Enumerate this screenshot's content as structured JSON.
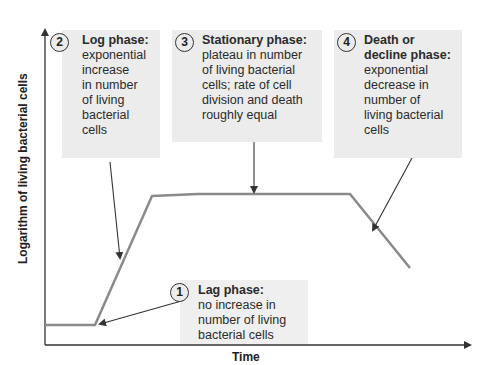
{
  "axes": {
    "y_label": "Logarithm of living bacterial cells",
    "x_label": "Time"
  },
  "phases": [
    {
      "number": "1",
      "title": "Lag phase:",
      "lines": [
        "no increase in",
        "number of living",
        "bacterial cells"
      ]
    },
    {
      "number": "2",
      "title": "Log phase:",
      "lines": [
        "exponential",
        "increase",
        "in number",
        "of living",
        "bacterial",
        "cells"
      ]
    },
    {
      "number": "3",
      "title": "Stationary phase:",
      "lines": [
        "plateau in number",
        "of living bacterial",
        "cells; rate of cell",
        "division and death",
        "roughly equal"
      ]
    },
    {
      "number": "4",
      "title_lines": [
        "Death or",
        "decline phase:"
      ],
      "lines": [
        "exponential",
        "decrease in",
        "number of",
        "living bacterial",
        "cells"
      ]
    }
  ],
  "colors": {
    "curve": "#8a8a8a",
    "axis": "#333333",
    "box_bg": "#ececec",
    "text": "#2b2b2b"
  }
}
